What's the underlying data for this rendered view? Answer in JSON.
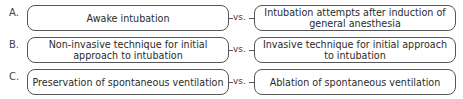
{
  "diagram": {
    "rows": [
      {
        "label": "A.",
        "left": "Awake intubation",
        "connector": "vs.",
        "right": "Intubation attempts after induction of general anesthesia"
      },
      {
        "label": "B.",
        "left": "Non-invasive technique for initial approach to intubation",
        "connector": "vs.",
        "right": "Invasive technique for initial approach to intubation"
      },
      {
        "label": "C.",
        "left": "Preservation of spontaneous ventilation",
        "connector": "vs.",
        "right": "Ablation of spontaneous ventilation"
      }
    ]
  }
}
